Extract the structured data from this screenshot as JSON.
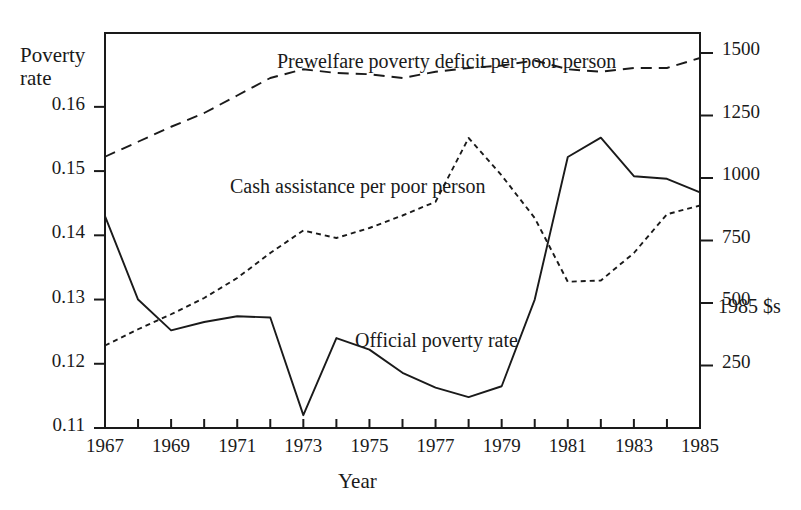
{
  "chart_data": {
    "type": "line",
    "title": "",
    "xlabel": "Year",
    "ylabel": "Poverty rate",
    "y2label": "1985 $s",
    "grid": false,
    "legend_position": "inline-annotations",
    "x": [
      1967,
      1968,
      1969,
      1970,
      1971,
      1972,
      1973,
      1974,
      1975,
      1976,
      1977,
      1978,
      1979,
      1980,
      1981,
      1982,
      1983,
      1984,
      1985
    ],
    "xlim": [
      1967,
      1985
    ],
    "xticks": [
      1967,
      1968,
      1969,
      1970,
      1971,
      1972,
      1973,
      1974,
      1975,
      1976,
      1977,
      1978,
      1979,
      1980,
      1981,
      1982,
      1983,
      1984,
      1985
    ],
    "xticklabels": [
      "1967",
      "",
      "1969",
      "",
      "1971",
      "",
      "1973",
      "",
      "1975",
      "",
      "1977",
      "",
      "1979",
      "",
      "1981",
      "",
      "1983",
      "",
      "1985"
    ],
    "ylim_left": [
      0.11,
      0.1715
    ],
    "yticks_left": [
      0.11,
      0.12,
      0.13,
      0.14,
      0.15,
      0.16
    ],
    "yticklabels_left": [
      "0.11",
      "0.12",
      "0.13",
      "0.14",
      "0.15",
      "0.16"
    ],
    "ylim_right": [
      0,
      1580
    ],
    "yticks_right": [
      250,
      500,
      750,
      1000,
      1250,
      1500
    ],
    "yticklabels_right": [
      "250",
      "500",
      "750",
      "1000",
      "1250",
      "1500"
    ],
    "series": [
      {
        "name": "Official poverty rate",
        "axis": "left",
        "style": "solid",
        "label_text": "Official poverty rate",
        "values": [
          0.143,
          0.13,
          0.1252,
          0.1265,
          0.1274,
          0.1272,
          0.112,
          0.124,
          0.1222,
          0.1186,
          0.1163,
          0.1148,
          0.1165,
          0.13,
          0.1522,
          0.1552,
          0.1492,
          0.1488,
          0.1467
        ]
      },
      {
        "name": "Cash assistance per poor person",
        "axis": "right",
        "style": "dotted",
        "label_text": "Cash assistance per poor person",
        "values": [
          330,
          395,
          455,
          520,
          600,
          700,
          790,
          760,
          800,
          850,
          905,
          1160,
          1010,
          840,
          585,
          590,
          700,
          855,
          890
        ]
      },
      {
        "name": "Prewelfare poverty deficit per poor person",
        "axis": "right",
        "style": "dashed",
        "label_text": "Prewelfare poverty deficit per poor person",
        "values": [
          1085,
          1145,
          1205,
          1260,
          1330,
          1400,
          1435,
          1420,
          1415,
          1400,
          1425,
          1440,
          1450,
          1470,
          1435,
          1425,
          1440,
          1440,
          1480
        ]
      }
    ]
  },
  "labels": {
    "y_axis_line1": "Poverty",
    "y_axis_line2": "rate",
    "x_axis": "Year",
    "right_axis_unit": "1985 $s"
  }
}
